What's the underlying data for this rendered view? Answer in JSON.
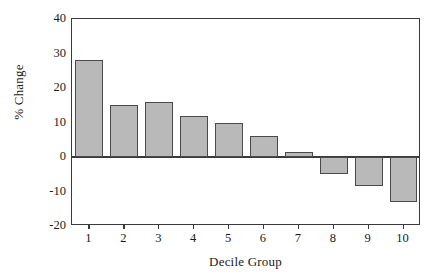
{
  "chart_data": {
    "type": "bar",
    "title": "",
    "xlabel": "Decile Group",
    "ylabel": "% Change",
    "categories": [
      "1",
      "2",
      "3",
      "4",
      "5",
      "6",
      "7",
      "8",
      "9",
      "10"
    ],
    "values": [
      28,
      15,
      16,
      12,
      10,
      6,
      1.5,
      -5,
      -8.5,
      -13
    ],
    "series": [
      {
        "name": "% Change",
        "values": [
          28,
          15,
          16,
          12,
          10,
          6,
          1.5,
          -5,
          -8.5,
          -13
        ]
      }
    ],
    "ylim": [
      -20,
      40
    ],
    "yticks": [
      40,
      30,
      20,
      10,
      0,
      -10,
      -20
    ],
    "ytick_labels": [
      "40",
      "30",
      "20",
      "10",
      "0",
      "-10",
      "-20"
    ],
    "grid": false,
    "legend": false,
    "legend_position": "none",
    "bar_fill_color": "#b9b9b9",
    "bar_edge_color": "#4a4a4a",
    "axis_color": "#3a3a3a",
    "background_color": "#ffffff"
  }
}
